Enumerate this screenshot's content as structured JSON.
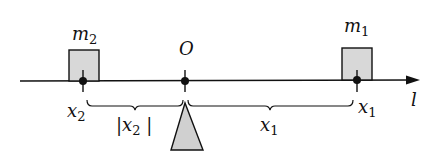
{
  "diagram": {
    "axis": {
      "label": "l",
      "color": "#111111"
    },
    "origin": {
      "label": "O"
    },
    "masses": [
      {
        "id": "m2",
        "label": "m",
        "subscript": "2",
        "position_label": "x",
        "position_sub": "2"
      },
      {
        "id": "m1",
        "label": "m",
        "subscript": "1",
        "position_label": "x",
        "position_sub": "1"
      }
    ],
    "distances": [
      {
        "id": "left",
        "label": "|x",
        "subscript": "2",
        "suffix": " |"
      },
      {
        "id": "right",
        "label": "x",
        "subscript": "1"
      }
    ],
    "colors": {
      "fill": "#d6d6d6",
      "stroke": "#111111"
    }
  }
}
